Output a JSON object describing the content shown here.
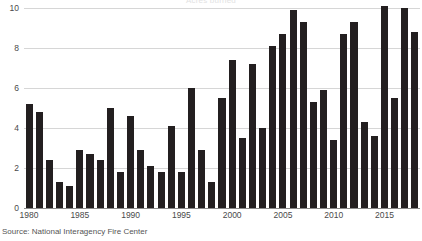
{
  "chart_data": {
    "type": "bar",
    "title": "Acres burned",
    "xlabel": "",
    "ylabel": "",
    "ylim": [
      0,
      10
    ],
    "yticks": [
      0,
      2,
      4,
      6,
      8,
      10
    ],
    "ytick_labels": [
      "0",
      "2",
      "4",
      "6",
      "8",
      "10"
    ],
    "xticks": [
      1980,
      1985,
      1990,
      1995,
      2000,
      2005,
      2010,
      2015
    ],
    "xtick_labels": [
      "1980",
      "1985",
      "1990",
      "1995",
      "2000",
      "2005",
      "2010",
      "2015"
    ],
    "grid": true,
    "legend": false,
    "bar_color": "#231f20",
    "grid_color": "#d6d6d6",
    "axis_color": "#8a8a8a",
    "categories": [
      "1980",
      "1981",
      "1982",
      "1983",
      "1984",
      "1985",
      "1986",
      "1987",
      "1988",
      "1989",
      "1990",
      "1991",
      "1992",
      "1993",
      "1994",
      "1995",
      "1996",
      "1997",
      "1998",
      "1999",
      "2000",
      "2001",
      "2002",
      "2003",
      "2004",
      "2005",
      "2006",
      "2007",
      "2008",
      "2009",
      "2010",
      "2011",
      "2012",
      "2013",
      "2014",
      "2015",
      "2016",
      "2017",
      "2018"
    ],
    "values": [
      5.2,
      4.8,
      2.4,
      1.3,
      1.1,
      2.9,
      2.7,
      2.4,
      5.0,
      1.8,
      4.6,
      2.9,
      2.1,
      1.8,
      4.1,
      1.8,
      6.0,
      2.9,
      1.3,
      5.5,
      7.4,
      3.5,
      7.2,
      4.0,
      8.1,
      8.7,
      9.9,
      9.3,
      5.3,
      5.9,
      3.4,
      8.7,
      9.3,
      4.3,
      3.6,
      10.1,
      5.5,
      10.0,
      8.8
    ],
    "source": "Source: National Interagency Fire Center"
  },
  "figure": {
    "source_note": "Source: National Interagency Fire Center"
  }
}
